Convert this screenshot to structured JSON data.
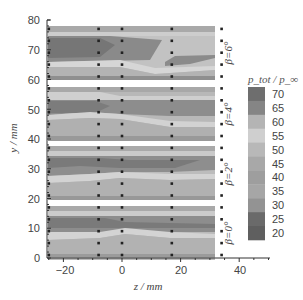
{
  "chart_data": {
    "type": "heatmap",
    "title": "",
    "xlabel": "z / mm",
    "ylabel": "y / mm",
    "xlim": [
      -26,
      34
    ],
    "ylim": [
      0,
      80
    ],
    "x_ticks": [
      -20,
      0,
      20,
      40
    ],
    "y_ticks": [
      0,
      10,
      20,
      30,
      40,
      50,
      60,
      70,
      80
    ],
    "grid": false,
    "colorbar": {
      "title": "p_tot / p_∞",
      "levels": [
        70,
        65,
        60,
        55,
        50,
        45,
        40,
        35,
        30,
        25,
        20
      ],
      "colors": [
        "#6e6e6e",
        "#858585",
        "#b4b4b4",
        "#cfcfcf",
        "#b8b8b8",
        "#a8a8a8",
        "#9e9e9e",
        "#a6a6a6",
        "#939393",
        "#6a6a6a",
        "#5f5f5f"
      ]
    },
    "measurement_columns_z": [
      -25,
      -8,
      0,
      17,
      34
    ],
    "panels": [
      {
        "label": "β=6°",
        "y_range": [
          61,
          77
        ],
        "probe_y": [
          61,
          65,
          69,
          73,
          77
        ]
      },
      {
        "label": "β=4°",
        "y_range": [
          41,
          57
        ],
        "probe_y": [
          41,
          45,
          49,
          53,
          57
        ]
      },
      {
        "label": "β=2°",
        "y_range": [
          21,
          37
        ],
        "probe_y": [
          21,
          25,
          29,
          33,
          37
        ]
      },
      {
        "label": "β=0°",
        "y_range": [
          1,
          17
        ],
        "probe_y": [
          1,
          5,
          9,
          13,
          17
        ]
      }
    ],
    "legend_position": "right"
  },
  "axes": {
    "xlabel": "z / mm",
    "ylabel": "y / mm",
    "x_tick_labels": [
      "−20",
      "0",
      "20",
      "40"
    ],
    "y_tick_labels": [
      "0",
      "10",
      "20",
      "30",
      "40",
      "50",
      "60",
      "70",
      "80"
    ]
  },
  "panels": {
    "beta6": "β=6°",
    "beta4": "β=4°",
    "beta2": "β=2°",
    "beta0": "β=0°"
  },
  "colorbar": {
    "title": "p_tot / p_∞",
    "labels": [
      "70",
      "65",
      "60",
      "55",
      "50",
      "45",
      "40",
      "35",
      "30",
      "25",
      "20"
    ]
  }
}
